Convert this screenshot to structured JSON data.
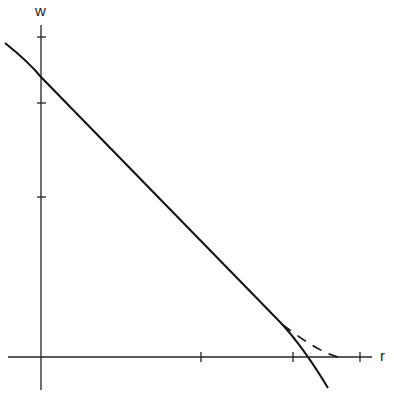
{
  "diagram": {
    "axes": {
      "x_label": "r",
      "y_label": "w"
    },
    "x_ticks_px": [
      201,
      293,
      360
    ],
    "y_ticks_px": [
      37,
      103,
      197
    ],
    "curves": [
      {
        "name": "solid-curve",
        "style": "solid",
        "description": "decreasing, nearly linear curve crossing the r-axis"
      },
      {
        "name": "dashed-curve",
        "style": "dashed",
        "description": "branch that levels off tangentially onto the r-axis"
      }
    ]
  }
}
